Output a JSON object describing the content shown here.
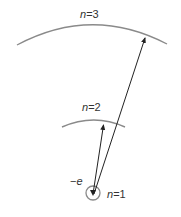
{
  "diagram": {
    "colors": {
      "orbit": "#8a8a8a",
      "arrow": "#222222",
      "text": "#333333",
      "background": "#ffffff"
    },
    "levels": [
      {
        "n": "1",
        "label_var": "n",
        "label_eq": "=",
        "label_val": "1"
      },
      {
        "n": "2",
        "label_var": "n",
        "label_eq": "=",
        "label_val": "2"
      },
      {
        "n": "3",
        "label_var": "n",
        "label_eq": "=",
        "label_val": "3"
      }
    ],
    "electron": {
      "sign": "−",
      "symbol": "e"
    },
    "transitions": [
      {
        "from": "1",
        "to": "2"
      },
      {
        "from": "1",
        "to": "3"
      }
    ]
  }
}
